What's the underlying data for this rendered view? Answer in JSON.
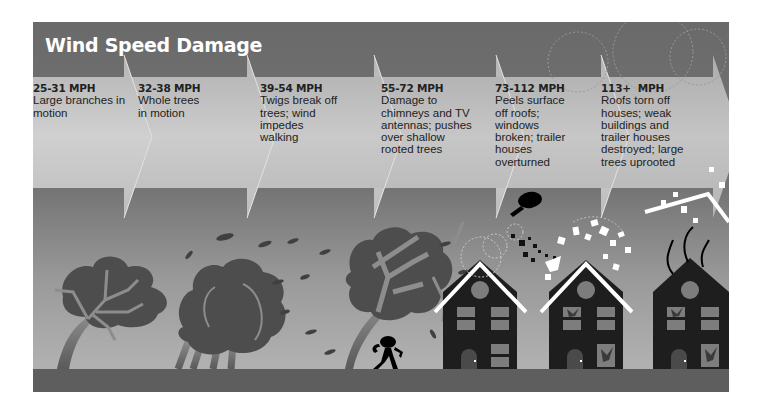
{
  "title": "Wind Speed Damage",
  "stages": [
    {
      "mph": "25-31 MPH",
      "description": "Large branches in motion",
      "lines": [
        "Large branches in",
        "motion"
      ]
    },
    {
      "mph": "32-38 MPH",
      "description": "Whole trees in motion",
      "lines": [
        "Whole trees",
        "in motion"
      ]
    },
    {
      "mph": "39-54 MPH",
      "description": "Twigs break off trees; wind impedes walking",
      "lines": [
        "Twigs break off",
        "trees; wind",
        "impedes",
        "walking"
      ]
    },
    {
      "mph": "55-72 MPH",
      "description": "Damage to chimneys and TV antennas; pushes over shallow rooted trees",
      "lines": [
        "Damage to",
        "chimneys and TV",
        "antennas; pushes",
        "over shallow",
        "rooted trees"
      ]
    },
    {
      "mph": "73-112 MPH",
      "description": "Peels surface off roofs; windows broken; trailer houses overturned",
      "lines": [
        "Peels surface",
        "off roofs;",
        "windows",
        "broken; trailer",
        "houses",
        "overturned"
      ]
    },
    {
      "mph": "113+  MPH",
      "description": "Roofs torn off houses; weak buildings and trailer houses destroyed; large trees uprooted",
      "lines": [
        "Roofs torn off",
        "houses; weak",
        "buildings and",
        "trailer houses",
        "destroyed; large",
        "trees uprooted"
      ]
    }
  ],
  "colors": {
    "background": "#707070",
    "chevron": "#c8c8c8",
    "ground": "#5e5e5e",
    "tree": "#4f4f4f",
    "house": "#1e1e1e",
    "roof_line": "#ffffff",
    "text": "#222222"
  }
}
